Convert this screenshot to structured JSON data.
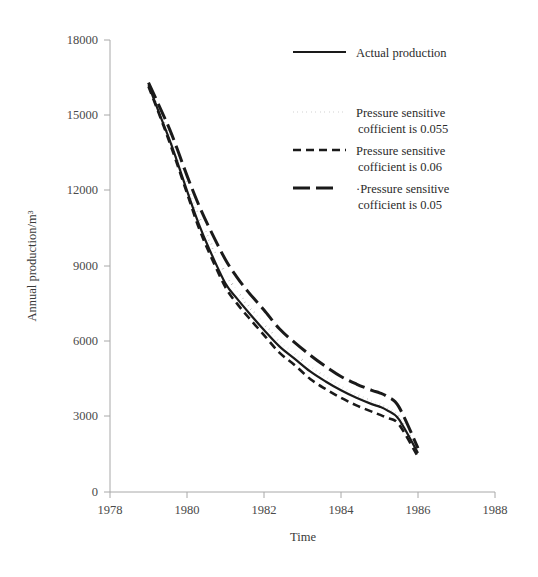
{
  "chart_data": {
    "type": "line",
    "title": "",
    "xlabel": "Time",
    "ylabel": "Annual production/m³",
    "xlim": [
      1978,
      1988
    ],
    "ylim": [
      0,
      18000
    ],
    "xticks": [
      1978,
      1980,
      1982,
      1984,
      1986,
      1988
    ],
    "xticklabels": [
      "1978",
      "1980",
      "1982",
      "1984",
      "1986",
      "1988"
    ],
    "yticks": [
      0,
      3000,
      6000,
      9000,
      12000,
      15000,
      18000
    ],
    "yticklabels": [
      "0",
      "3000",
      "6000",
      "9000",
      "12000",
      "15000",
      "18000"
    ],
    "grid": false,
    "legend_position": "upper right",
    "x": [
      1979.0,
      1979.3,
      1979.6,
      1980.0,
      1980.3,
      1980.6,
      1981.0,
      1981.3,
      1981.6,
      1982.0,
      1982.4,
      1982.8,
      1983.2,
      1983.6,
      1984.0,
      1984.4,
      1984.8,
      1985.0,
      1985.2,
      1985.5,
      1986.0
    ],
    "series": [
      {
        "name": "Actual production",
        "style": "solid",
        "color": "#1a1a1a",
        "values": [
          16200,
          15000,
          13800,
          12000,
          10700,
          9600,
          8300,
          7700,
          7150,
          6450,
          5800,
          5300,
          4800,
          4400,
          4050,
          3750,
          3500,
          3400,
          3250,
          2900,
          1550
        ]
      },
      {
        "name": "Pressure sensitive cofficient is 0.055",
        "style": "dotted",
        "color": "#1a1a1a",
        "values": [
          16200,
          15100,
          13950,
          12250,
          11000,
          9950,
          8700,
          8000,
          7400,
          6700,
          6000,
          5500,
          5000,
          4600,
          4200,
          3880,
          3620,
          3500,
          3350,
          3000,
          1600
        ]
      },
      {
        "name": "Pressure sensitive cofficient is 0.06",
        "style": "dashed",
        "color": "#1a1a1a",
        "values": [
          16150,
          14950,
          13700,
          11900,
          10550,
          9450,
          8150,
          7500,
          6950,
          6250,
          5550,
          5050,
          4500,
          4100,
          3750,
          3450,
          3200,
          3080,
          2950,
          2700,
          1400
        ]
      },
      {
        "name": "Pressure sensitive cofficient is 0.05",
        "style": "longdash",
        "color": "#1a1a1a",
        "values": [
          16300,
          15300,
          14250,
          12600,
          11450,
          10450,
          9250,
          8550,
          7950,
          7250,
          6500,
          5950,
          5450,
          5000,
          4600,
          4300,
          4050,
          3950,
          3800,
          3400,
          1750
        ]
      }
    ]
  },
  "legend": {
    "items": [
      {
        "label": "Actual production",
        "label2": "",
        "style": "solid"
      },
      {
        "label": "Pressure sensitive",
        "label2": "cofficient is 0.055",
        "style": "dotted"
      },
      {
        "label": "Pressure sensitive",
        "label2": "cofficient is 0.06",
        "style": "dashed"
      },
      {
        "label": "·Pressure sensitive",
        "label2": "cofficient is 0.05",
        "style": "longdash"
      }
    ]
  },
  "axes": {
    "xlabel": "Time",
    "ylabel": "Annual production/m³",
    "xticklabels": [
      "1978",
      "1980",
      "1982",
      "1984",
      "1986",
      "1988"
    ],
    "yticklabels": [
      "0",
      "3000",
      "6000",
      "9000",
      "12000",
      "15000",
      "18000"
    ]
  }
}
